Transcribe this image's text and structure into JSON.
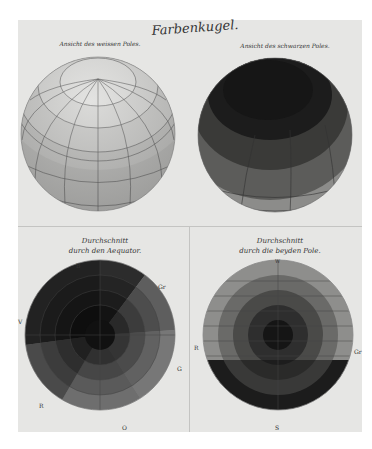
{
  "plate": {
    "title": "Farbenkugel.",
    "views": [
      {
        "caption": "Ansicht des weissen Poles.",
        "type": "sphere",
        "tone": "light"
      },
      {
        "caption": "Ansicht des schwarzen Poles.",
        "type": "sphere",
        "tone": "dark"
      }
    ],
    "sections": [
      {
        "caption_line1": "Durchschnitt",
        "caption_line2": "durch den Aequator.",
        "labels": {
          "top": "B",
          "top_right": "Gr",
          "left": "V",
          "right": "G",
          "bottom_left": "R",
          "bottom": "O"
        }
      },
      {
        "caption_line1": "Durchschnitt",
        "caption_line2": "durch die beyden Pole.",
        "labels": {
          "top": "W",
          "left": "R",
          "right": "Gr",
          "bottom": "S"
        }
      }
    ]
  },
  "colors": {
    "paper": "#e6e6e4",
    "ink": "#333333",
    "sphere_light": "#c9c9c7",
    "sphere_dark": "#3a3a3a"
  }
}
